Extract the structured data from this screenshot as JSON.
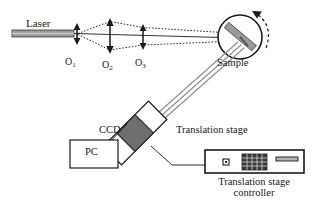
{
  "figure": {
    "type": "optical-schematic"
  },
  "labels": {
    "laser": "Laser",
    "lens1": "O",
    "lens1_sub": "1",
    "lens2": "O",
    "lens2_sub": "2",
    "lens3": "O",
    "lens3_sub": "3",
    "sample": "Sample",
    "ccd": "CCD",
    "pc": "PC",
    "translation_stage": "Translation stage",
    "controller_line1": "Translation stage",
    "controller_line2": "controller"
  },
  "components": {
    "laser_source": "laser-bar",
    "lenses": [
      "O1",
      "O2",
      "O3"
    ],
    "sample_holder": "rotating-sample",
    "detector": "ccd-sensor",
    "computer": "pc-box",
    "stage": "translation-stage",
    "controller": "translation-stage-controller"
  },
  "colors": {
    "stroke": "#1a1a1a",
    "laser_body": "#9a9a9a",
    "sample_bar": "#9a9a9a",
    "ccd_fill": "#6e6e6e",
    "beam": "#8a8a8a",
    "keypad": "#2a2a2a",
    "background": "#ffffff"
  },
  "annotations": {
    "rotation_arrow": "sample-rotation-direction",
    "beam_rays": "dotted-illumination-rays",
    "reflected_beam": "reflected-beam-to-ccd"
  }
}
